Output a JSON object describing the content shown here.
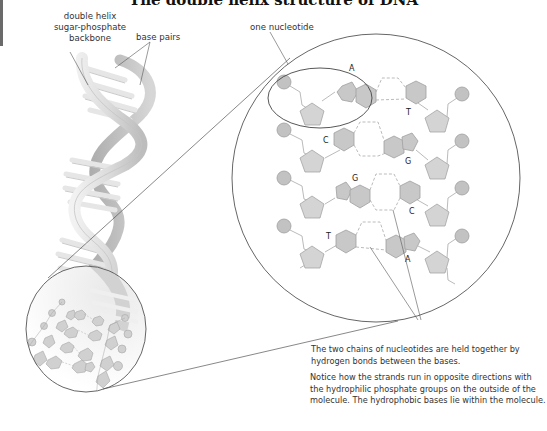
{
  "header": {
    "clipped_title": "The double helix structure of DNA"
  },
  "labels": {
    "backbone": [
      "double helix",
      "sugar-phosphate",
      "backbone"
    ],
    "base_pairs": "base pairs",
    "one_nucleotide": "one nucleotide"
  },
  "bases": {
    "pair1": {
      "left": "A",
      "right": "T"
    },
    "pair2": {
      "left": "C",
      "right": "G"
    },
    "pair3": {
      "left": "G",
      "right": "C"
    },
    "pair4": {
      "left": "T",
      "right": "A"
    }
  },
  "captions": {
    "hydrogen_bonds": "The two chains of nucleotides are held together by hydrogen bonds between the bases.",
    "orientation": "Notice how the strands run in opposite directions with the hydrophilic phosphate groups on the outside of the molecule. The hydrophobic bases lie within the molecule."
  },
  "colors": {
    "phosphate": "#c2c2c2",
    "sugar": "#d4d4d4",
    "base": "#c8c8c8",
    "outline": "#9a9a9a",
    "circle_line": "#555555",
    "hbond": "#aaaaaa"
  }
}
